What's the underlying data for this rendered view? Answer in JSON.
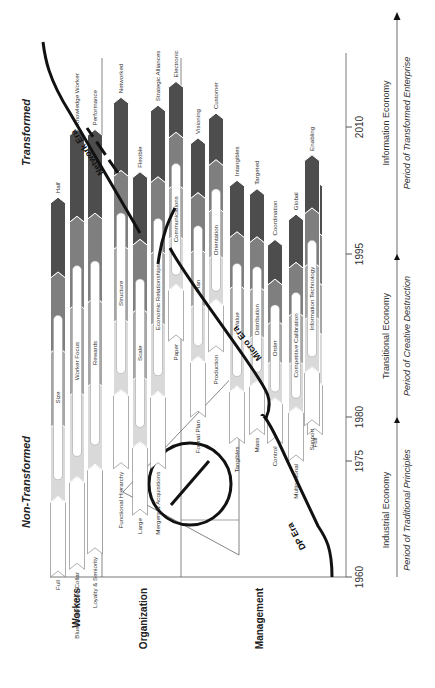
{
  "labels": {
    "transformed": "Transformed",
    "non_transformed": "Non-Transformed"
  },
  "rows": [
    {
      "label": "Workers"
    },
    {
      "label": "Organization"
    },
    {
      "label": "Management"
    }
  ],
  "years": [
    "1960",
    "1975",
    "1980",
    "1995",
    "2010"
  ],
  "economies": [
    "Industrial Economy",
    "Transitional Economy",
    "Information Economy"
  ],
  "periods": [
    "Period of Traditional Principles",
    "Period of Creative Destruction",
    "Period of Transformed Enterprise"
  ],
  "eras": [
    "DP Era",
    "Micro Era",
    "Network Era"
  ],
  "colors": {
    "stage1": "#ffffff",
    "stage2": "#d9d9d9",
    "stage3": "#a6a6a6",
    "stage4": "#7f7f7f",
    "stage5": "#4d4d4d",
    "line": "#111111"
  },
  "columns": [
    {
      "row": 0,
      "start_year": 1960,
      "end_year": 2001,
      "from_label": "Full",
      "mid_label": "Size",
      "to_label": "Half"
    },
    {
      "row": 0,
      "start_year": 1961,
      "end_year": 2009,
      "from_label": "Blue-Collar/White-Collar",
      "mid_label": "Worker Focus",
      "to_label": "Knowledge Worker"
    },
    {
      "row": 0,
      "start_year": 1963,
      "end_year": 2009,
      "from_label": "Loyalty & Seniority",
      "mid_label": "Rewards",
      "to_label": "Performance"
    },
    {
      "row": 1,
      "start_year": 1974,
      "end_year": 2013,
      "from_label": "Functional Hierarchy",
      "mid_label": "Structure",
      "to_label": "Networked"
    },
    {
      "row": 1,
      "start_year": 1968,
      "end_year": 2004,
      "from_label": "Large",
      "mid_label": "Scale",
      "to_label": "Flexible"
    },
    {
      "row": 1,
      "start_year": 1974,
      "end_year": 2012,
      "from_label": "Mergers & Acquisitions",
      "mid_label": "Economic Relationships",
      "to_label": "Strategic Alliances"
    },
    {
      "row": 1,
      "start_year": 1987,
      "end_year": 2015,
      "from_label": "Paper",
      "mid_label": "Communications",
      "to_label": "Electronic"
    },
    {
      "row": 2,
      "start_year": 1980,
      "end_year": 2008,
      "from_label": "Formal Plan",
      "mid_label": "Plan",
      "to_label": "Visioning"
    },
    {
      "row": 2,
      "start_year": 1986,
      "end_year": 2011,
      "from_label": "Production",
      "mid_label": "Orientation",
      "to_label": "Customer"
    },
    {
      "row": 2,
      "start_year": 1977,
      "end_year": 2003,
      "from_label": "Tangibles",
      "mid_label": "Value",
      "to_label": "Intangibles"
    },
    {
      "row": 2,
      "start_year": 1978,
      "end_year": 2002,
      "from_label": "Mass",
      "mid_label": "Distribution",
      "to_label": "Targeted"
    },
    {
      "row": 2,
      "start_year": 1977,
      "end_year": 1996,
      "from_label": "Control",
      "mid_label": "Order",
      "to_label": "Coordination"
    },
    {
      "row": 2,
      "start_year": 1975,
      "end_year": 1999,
      "from_label": "Multinational",
      "mid_label": "Competitive Calibration",
      "to_label": "Global"
    },
    {
      "row": 2,
      "start_year": 1978,
      "end_year": 2003,
      "from_label": "Full",
      "mid_label": "Time",
      "to_label": "Half"
    },
    {
      "row": 2,
      "start_year": 1979,
      "end_year": 2006,
      "from_label": "Support",
      "mid_label": "Information Technology",
      "to_label": "Enabling"
    }
  ]
}
